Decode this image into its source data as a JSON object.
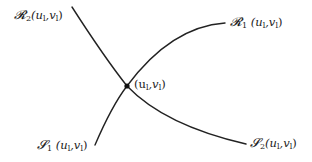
{
  "diagram": {
    "type": "wave-curves",
    "intersection_point": {
      "label": "(u_l,v_l)",
      "text": "(u",
      "sub1": "l",
      "mid": ",v",
      "sub2": "l",
      "close": ")"
    },
    "curves": [
      {
        "id": "R1",
        "letter": "𝓡",
        "index": "1",
        "args_a": " (u",
        "args_sub1": "l",
        "args_b": ",v",
        "args_sub2": "l",
        "args_c": ")"
      },
      {
        "id": "R2",
        "letter": "𝓡",
        "index": "2",
        "args_a": "(u",
        "args_sub1": "l",
        "args_b": ",v",
        "args_sub2": "l",
        "args_c": ")"
      },
      {
        "id": "S1",
        "letter": "𝓢",
        "index": "1",
        "args_a": " (u",
        "args_sub1": "l",
        "args_b": ",v",
        "args_sub2": "l",
        "args_c": ")"
      },
      {
        "id": "S2",
        "letter": "𝓢",
        "index": "2",
        "args_a": "(u",
        "args_sub1": "l",
        "args_b": ",v",
        "args_sub2": "l",
        "args_c": ")"
      }
    ],
    "colors": {
      "stroke": "#222222",
      "background": "#ffffff"
    }
  }
}
